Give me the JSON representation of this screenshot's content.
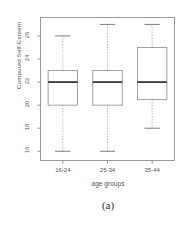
{
  "figure": {
    "caption": "(a)",
    "background_color": "#ffffff",
    "ink_color": "#4d4d4d"
  },
  "chart_data": {
    "type": "boxplot",
    "title": "",
    "xlabel": "age groups",
    "ylabel": "Computed Self-Esteem",
    "categories": [
      "16-24",
      "25-34",
      "35-44"
    ],
    "ylim": [
      15.2,
      27.6
    ],
    "yticks": [
      16,
      18,
      20,
      22,
      24,
      26
    ],
    "ytick_labels": [
      "16",
      "18",
      "20",
      "22",
      "24",
      "26"
    ],
    "grid": false,
    "legend": "none",
    "box_color": "#808080",
    "median_color": "#3a3a3a",
    "whisker_style": "dashed",
    "boxes": [
      {
        "category": "16-24",
        "whisker_low": 16,
        "q1": 20,
        "median": 22,
        "q3": 23,
        "whisker_high": 26,
        "outliers": []
      },
      {
        "category": "25-34",
        "whisker_low": 16,
        "q1": 20,
        "median": 22,
        "q3": 23,
        "whisker_high": 27,
        "outliers": []
      },
      {
        "category": "35-44",
        "whisker_low": 18,
        "q1": 20.5,
        "median": 22,
        "q3": 25,
        "whisker_high": 27,
        "outliers": []
      }
    ]
  }
}
